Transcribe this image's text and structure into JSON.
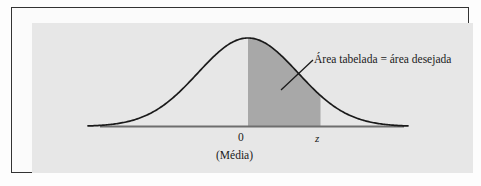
{
  "figure": {
    "kind": "normal-distribution-diagram",
    "language": "pt-BR",
    "annotation": "Área tabelada = área desejada",
    "labels": {
      "zero": "0",
      "z": "z",
      "mean": "(Média)"
    },
    "colors": {
      "page_background": "#ffffff",
      "frame_border": "#333333",
      "panel_background": "#e7e7e7",
      "shaded_area": "#a8a8a8",
      "curve_stroke": "#1a1a1a",
      "axis_stroke": "#6e6e6e",
      "text": "#1a1a1a"
    }
  },
  "chart_data": {
    "type": "area",
    "title": "",
    "subtitle": "",
    "xlabel": "",
    "ylabel": "",
    "distribution": "standard normal",
    "mean": 0,
    "std_dev": 1,
    "xlim": [
      -3.2,
      3.2
    ],
    "ylim": [
      0,
      0.42
    ],
    "grid": false,
    "legend_position": "none",
    "x_tick_labels": [
      "0",
      "z"
    ],
    "x_tick_values": [
      0,
      1.45
    ],
    "secondary_tick_labels": [
      "(Média)"
    ],
    "shaded_region": {
      "from": 0,
      "to": 1.45,
      "label": "Área tabelada = área desejada",
      "fill": "#a8a8a8"
    },
    "annotations": [
      {
        "text": "Área tabelada = área desejada",
        "leader_line": true,
        "points_to_region": "shaded_region"
      }
    ],
    "x": [
      -3.2,
      -3.0,
      -2.8,
      -2.6,
      -2.4,
      -2.2,
      -2.0,
      -1.8,
      -1.6,
      -1.4,
      -1.2,
      -1.0,
      -0.8,
      -0.6,
      -0.4,
      -0.2,
      0.0,
      0.2,
      0.4,
      0.6,
      0.8,
      1.0,
      1.2,
      1.4,
      1.6,
      1.8,
      2.0,
      2.2,
      2.4,
      2.6,
      2.8,
      3.0,
      3.2
    ],
    "y": [
      0.0024,
      0.0044,
      0.0079,
      0.0136,
      0.0224,
      0.0355,
      0.054,
      0.079,
      0.1109,
      0.1497,
      0.1942,
      0.242,
      0.2897,
      0.3332,
      0.3683,
      0.391,
      0.3989,
      0.391,
      0.3683,
      0.3332,
      0.2897,
      0.242,
      0.1942,
      0.1497,
      0.1109,
      0.079,
      0.054,
      0.0355,
      0.0224,
      0.0136,
      0.0079,
      0.0044,
      0.0024
    ]
  }
}
